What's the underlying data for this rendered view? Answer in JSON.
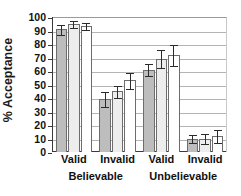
{
  "chart_data": {
    "type": "bar",
    "title": "",
    "subtitle": "",
    "xlabel": "",
    "ylabel": "% Acceptance",
    "ylim": [
      0,
      100
    ],
    "ytick_values": [
      0,
      10,
      20,
      30,
      40,
      50,
      60,
      70,
      80,
      90,
      100
    ],
    "ytick_labels": [
      "0",
      "10",
      "20",
      "30",
      "40",
      "50",
      "60",
      "70",
      "80",
      "90",
      "100"
    ],
    "grid": true,
    "grid_axis": "y",
    "legend": false,
    "legend_position": "none",
    "categories": [
      "Valid",
      "Invalid",
      "Valid",
      "Invalid"
    ],
    "supercategories": [
      {
        "label": "Believable",
        "spans": [
          0,
          1
        ]
      },
      {
        "label": "Unbelievable",
        "spans": [
          2,
          3
        ]
      }
    ],
    "series": [
      {
        "name": "series-1",
        "color": "#bdbdbd",
        "values": [
          91,
          39,
          61,
          10
        ],
        "errors": [
          4,
          6,
          5,
          3
        ]
      },
      {
        "name": "series-2",
        "color": "#ededed",
        "values": [
          95,
          45,
          69,
          10
        ],
        "errors": [
          3,
          5,
          7,
          4
        ]
      },
      {
        "name": "series-3",
        "color": "#ffffff",
        "values": [
          93,
          53,
          72,
          12
        ],
        "errors": [
          3,
          6,
          8,
          5
        ]
      }
    ],
    "error_bar_type": "symmetric"
  },
  "axes": {
    "y_title": "% Acceptance"
  },
  "colors": {
    "axis": "#3a3a3a",
    "grid": "#b4b4b4",
    "bar_edge": "#6d6d6d",
    "error_bar": "#2b2b2b",
    "text": "#111111",
    "background": "#ffffff"
  }
}
